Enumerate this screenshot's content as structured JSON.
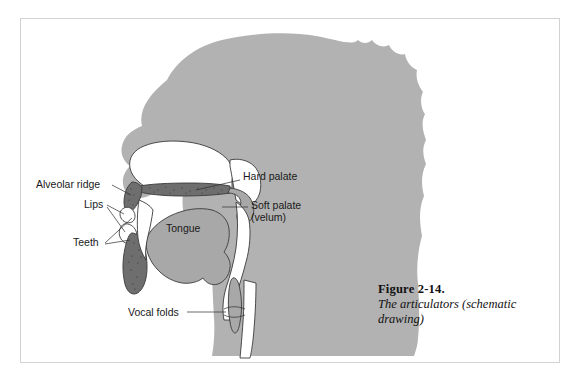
{
  "figure": {
    "number_label": "Figure 2-14.",
    "caption": "The articulators (schematic drawing)",
    "frame_border_color": "#d2d2d2",
    "background_color": "#ffffff"
  },
  "diagram": {
    "type": "schematic-anatomical-drawing",
    "colors": {
      "head_silhouette": "#b2b2b2",
      "tissue_gray": "#a8a8a8",
      "dark_tissue": "#6e6e6e",
      "cavity_white": "#ffffff",
      "outline": "#3a3a3a",
      "text": "#1a1a1a",
      "leader_line": "#2b2b2b"
    },
    "labels": [
      {
        "id": "alveolar-ridge",
        "text": "Alveolar ridge",
        "x": 36,
        "y": 188,
        "anchor": "start"
      },
      {
        "id": "lips",
        "text": "Lips",
        "x": 84,
        "y": 208,
        "anchor": "start"
      },
      {
        "id": "teeth",
        "text": "Teeth",
        "x": 73,
        "y": 245,
        "anchor": "start"
      },
      {
        "id": "tongue",
        "text": "Tongue",
        "x": 166,
        "y": 232,
        "anchor": "start"
      },
      {
        "id": "hard-palate",
        "text": "Hard palate",
        "x": 243,
        "y": 180,
        "anchor": "start"
      },
      {
        "id": "soft-palate",
        "text": "Soft palate",
        "x": 251,
        "y": 209,
        "anchor": "start"
      },
      {
        "id": "velum",
        "text": "(velum)",
        "x": 251,
        "y": 221,
        "anchor": "start"
      },
      {
        "id": "vocal-folds",
        "text": "Vocal folds",
        "x": 128,
        "y": 315,
        "anchor": "start"
      }
    ],
    "parts": [
      {
        "id": "head-silhouette",
        "name": "head-silhouette"
      },
      {
        "id": "nasal-cavity",
        "name": "nasal-cavity"
      },
      {
        "id": "hard-palate",
        "name": "hard-palate"
      },
      {
        "id": "soft-palate",
        "name": "soft-palate-velum"
      },
      {
        "id": "tongue",
        "name": "tongue"
      },
      {
        "id": "upper-lip",
        "name": "upper-lip"
      },
      {
        "id": "lower-lip",
        "name": "lower-lip"
      },
      {
        "id": "upper-teeth",
        "name": "upper-teeth"
      },
      {
        "id": "lower-teeth",
        "name": "lower-teeth"
      },
      {
        "id": "pharynx",
        "name": "pharyngeal-cavity"
      },
      {
        "id": "epiglottis",
        "name": "epiglottis"
      },
      {
        "id": "vocal-folds",
        "name": "vocal-folds"
      },
      {
        "id": "trachea",
        "name": "trachea"
      }
    ]
  }
}
